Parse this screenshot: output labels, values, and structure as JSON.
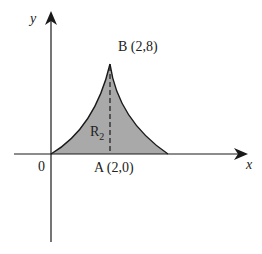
{
  "diagram": {
    "axes": {
      "x_label": "x",
      "y_label": "y",
      "origin_label": "0"
    },
    "points": {
      "A": {
        "label": "A (2,0)",
        "x": 2,
        "y": 0
      },
      "B": {
        "label": "B (2,8)",
        "x": 2,
        "y": 8
      }
    },
    "region": {
      "label_main": "R",
      "label_sub": "2",
      "fill": "#a9a9a9"
    },
    "colors": {
      "axis": "#1a1a1a",
      "curve": "#1a1a1a",
      "background": "#ffffff"
    }
  }
}
